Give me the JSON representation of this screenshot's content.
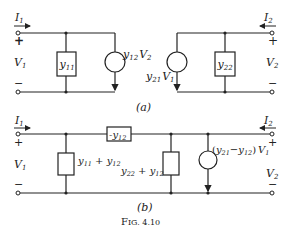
{
  "figure": {
    "caption": "Fig. 4.10",
    "caption_prefix": "F",
    "caption_rest": "IG. 4.10"
  },
  "circuit_a": {
    "label": "(a)",
    "left_port": {
      "current": "I",
      "current_sub": "1",
      "voltage": "V",
      "voltage_sub": "1",
      "plus": "+",
      "minus": "−"
    },
    "right_port": {
      "current": "I",
      "current_sub": "2",
      "voltage": "V",
      "voltage_sub": "2",
      "plus": "+",
      "minus": "−"
    },
    "admittance_left": {
      "sym": "y",
      "sub": "11"
    },
    "admittance_right": {
      "sym": "y",
      "sub": "22"
    },
    "source_left": {
      "sym": "y",
      "sub": "12",
      "var": "V",
      "var_sub": "2"
    },
    "source_right": {
      "sym": "y",
      "sub": "21",
      "var": "V",
      "var_sub": "1"
    }
  },
  "circuit_b": {
    "label": "(b)",
    "left_port": {
      "current": "I",
      "current_sub": "1",
      "voltage": "V",
      "voltage_sub": "1",
      "plus": "+",
      "minus": "−"
    },
    "right_port": {
      "current": "I",
      "current_sub": "2",
      "voltage": "V",
      "voltage_sub": "2",
      "plus": "+",
      "minus": "−"
    },
    "series_element": {
      "prefix": "-",
      "sym": "y",
      "sub": "12"
    },
    "shunt_left": {
      "sym1": "y",
      "sub1": "11",
      "op": " + ",
      "sym2": "y",
      "sub2": "12"
    },
    "shunt_right": {
      "sym1": "y",
      "sub1": "22",
      "op": " + ",
      "sym2": "y",
      "sub2": "12"
    },
    "source": {
      "open": "(",
      "sym1": "y",
      "sub1": "21",
      "op": "−",
      "sym2": "y",
      "sub2": "12",
      "close": ")",
      "var": "V",
      "var_sub": "1"
    }
  }
}
